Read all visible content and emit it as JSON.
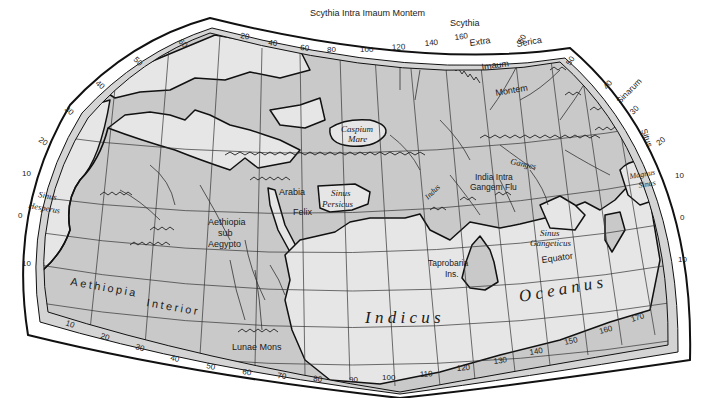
{
  "map": {
    "title": "Ptolemy's World Map",
    "colors": {
      "land": "#c9c9c9",
      "sea": "#e6e6e6",
      "frame": "#ffffff",
      "border_outer_band": "#d4d4d4",
      "line": "#111111"
    },
    "top_scale": {
      "labels": [
        "20",
        "40",
        "60",
        "80",
        "100",
        "120",
        "140",
        "160"
      ]
    },
    "bottom_scale": {
      "labels": [
        "10",
        "20",
        "30",
        "40",
        "50",
        "60",
        "70",
        "80",
        "90",
        "100",
        "110",
        "120",
        "130",
        "140",
        "150",
        "160",
        "170"
      ]
    },
    "left_scale": {
      "labels": [
        "60",
        "50",
        "40",
        "30",
        "20",
        "10",
        "0",
        "10"
      ]
    },
    "right_scale": {
      "labels": [
        "60",
        "50",
        "40",
        "30",
        "20",
        "10",
        "0",
        "10"
      ]
    },
    "regions": {
      "scythia_intra": "Scythia Intra Imaum Montem",
      "scythia": "Scythia",
      "extra": "Extra",
      "imaum": "Imaum",
      "montem": "Montem",
      "serica": "Serica",
      "sinarum": "Sinarum",
      "situs": "Situs",
      "arabia": "Arabia",
      "felix": "Felix",
      "aethiopia_sub_1": "Aethiopia",
      "aethiopia_sub_2": "sub",
      "aethiopia_sub_3": "Aegypto",
      "aethiopia_interior_1": "Aethiopia",
      "aethiopia_interior_2": "Interior",
      "india_intra_1": "India Intra",
      "india_intra_2": "Gangem Flu",
      "lunae_mons": "Lunae Mons",
      "taprobana_1": "Taprobaria",
      "taprobana_2": "Ins.",
      "equator": "Equator"
    },
    "water_bodies": {
      "caspium_1": "Caspium",
      "caspium_2": "Mare",
      "sinus_persicus_1": "Sinus",
      "sinus_persicus_2": "Persicus",
      "sinus_hesperus_1": "Sinus",
      "sinus_hesperus_2": "Hesperus",
      "sinus_gangeticus_1": "Sinus",
      "sinus_gangeticus_2": "Gangeticus",
      "magnus_sinus_1": "Magnus",
      "magnus_sinus_2": "Sinus",
      "indicus": "I n d i c u s",
      "oceanus": "O c e a n u s"
    },
    "rivers": {
      "ganges": "Ganges",
      "indus": "Indus"
    }
  }
}
